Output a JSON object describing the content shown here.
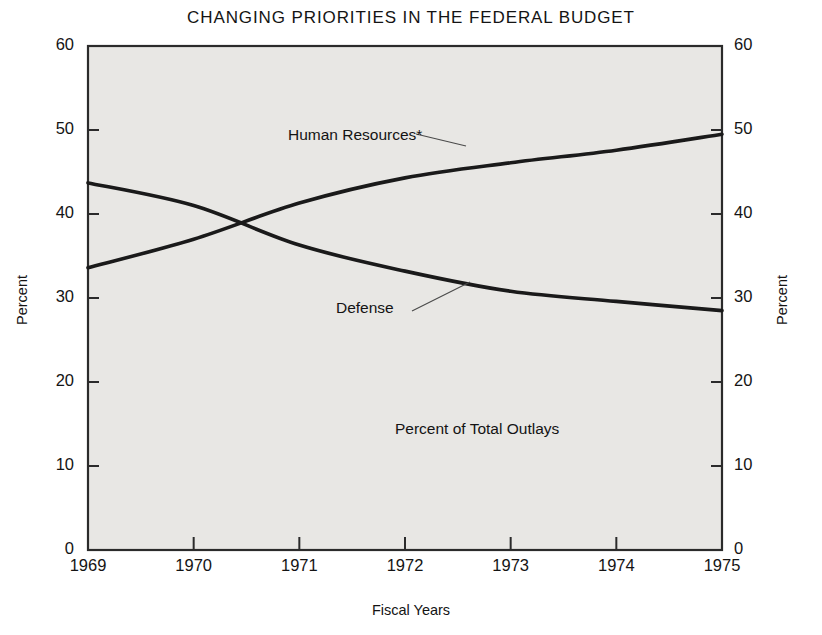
{
  "chart_data": {
    "type": "line",
    "title": "CHANGING PRIORITIES IN THE FEDERAL BUDGET",
    "subtitle": "",
    "xlabel": "Fiscal Years",
    "ylabel": "Percent",
    "ylabel_right": "Percent",
    "annotation": "Percent of Total Outlays",
    "x": [
      1969,
      1970,
      1971,
      1972,
      1973,
      1974,
      1975
    ],
    "xtick_labels": [
      "1969",
      "1970",
      "1971",
      "1972",
      "1973",
      "1974",
      "1975"
    ],
    "ytick_labels": [
      "0",
      "10",
      "20",
      "30",
      "40",
      "50",
      "60"
    ],
    "ytick_values": [
      0,
      10,
      20,
      30,
      40,
      50,
      60
    ],
    "xlim": [
      1969,
      1975
    ],
    "ylim": [
      0,
      60
    ],
    "grid": false,
    "legend_position": "inline-labels",
    "line_color": "#1a1a1a",
    "plot_background": "#e8e7e4",
    "series": [
      {
        "name": "Human Resources*",
        "label": "Human Resources*",
        "values": [
          33.6,
          37.0,
          41.3,
          44.3,
          46.1,
          47.6,
          49.5
        ]
      },
      {
        "name": "Defense",
        "label": "Defense",
        "values": [
          43.7,
          41.0,
          36.3,
          33.2,
          30.8,
          29.6,
          28.5
        ]
      }
    ]
  },
  "title": "CHANGING PRIORITIES IN THE FEDERAL BUDGET",
  "axes": {
    "left_title": "Percent",
    "right_title": "Percent",
    "bottom_title": "Fiscal Years"
  },
  "labels": {
    "human_resources": "Human Resources*",
    "defense": "Defense",
    "outlays_note": "Percent of Total Outlays"
  }
}
